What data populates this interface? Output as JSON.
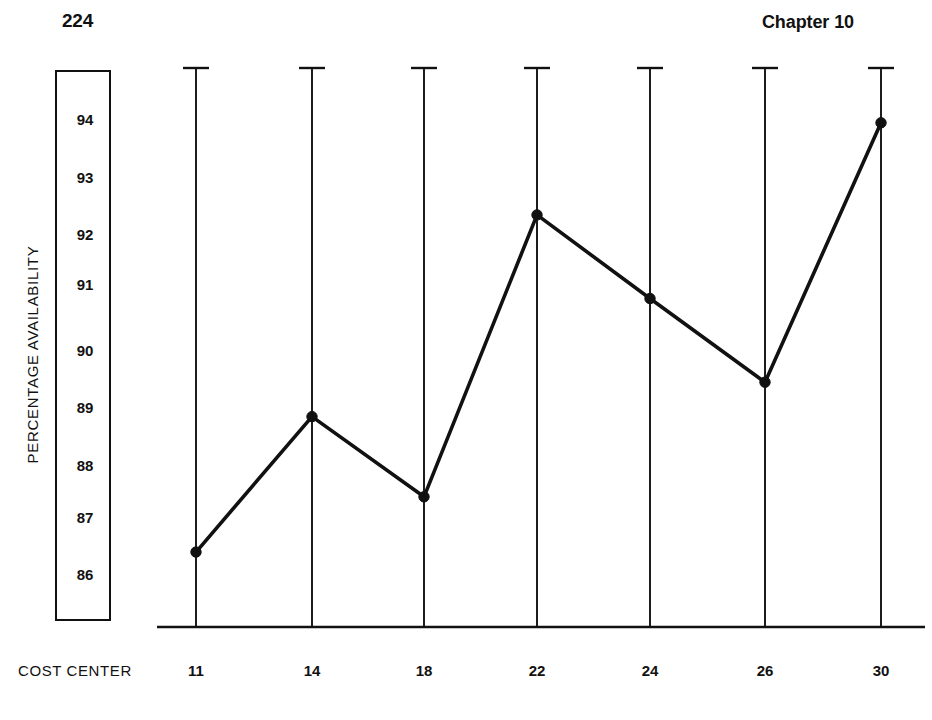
{
  "header": {
    "folio": "224",
    "chapter": "Chapter 10"
  },
  "chart_data": {
    "type": "line",
    "title": "",
    "subtitle": "",
    "xlabel": "COST CENTER",
    "ylabel": "PERCENTAGE AVAILABILITY",
    "categories": [
      "11",
      "14",
      "18",
      "22",
      "24",
      "26",
      "30"
    ],
    "values": [
      86.35,
      88.8,
      87.35,
      92.3,
      90.75,
      89.4,
      93.9
    ],
    "series": [
      {
        "name": "Percentage Availability",
        "values": [
          86.35,
          88.8,
          87.35,
          92.3,
          90.75,
          89.4,
          93.9
        ]
      }
    ],
    "y_ticks": [
      "94",
      "93",
      "92",
      "91",
      "90",
      "89",
      "88",
      "87",
      "86"
    ],
    "y_tick_values": [
      94,
      93,
      92,
      91,
      90,
      89,
      88,
      87,
      86
    ],
    "ylim": [
      85.1,
      94.9
    ],
    "xlim": [
      0,
      8
    ],
    "grid": "vertical-category-lines-with-top-caps",
    "legend": "none",
    "marker": "filled-circle",
    "line_color": "#111111",
    "grid_color": "#111111",
    "baseline": "solid",
    "annotations": []
  },
  "axes": {
    "y_box_border_color": "#111111",
    "x_axis_label": "COST CENTER"
  }
}
